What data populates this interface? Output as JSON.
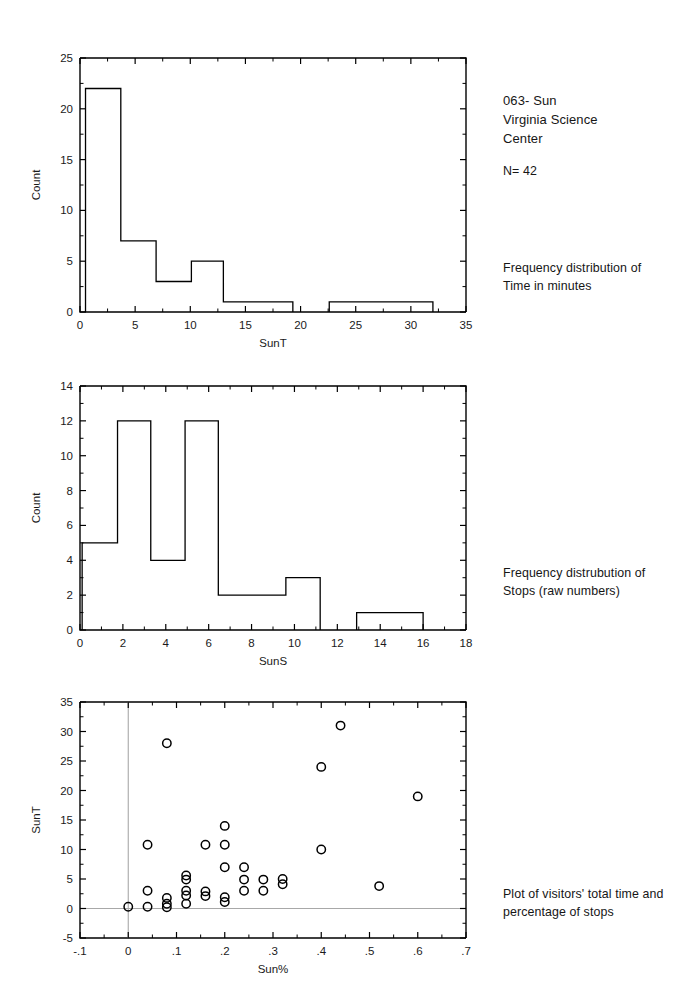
{
  "page": {
    "background": "#ffffff",
    "ink": "#000000",
    "grid_color": "#a8a8a8"
  },
  "annotations": {
    "header": "063- Sun\nVirginia Science\nCenter",
    "sample_size": "N= 42",
    "caption_1": "Frequency distribution of\nTime in minutes",
    "caption_2": "Frequency distrubution of\nStops (raw numbers)",
    "caption_3": "Plot of visitors' total time and\npercentage of stops"
  },
  "chart_data": [
    {
      "id": "sunt-histogram",
      "type": "bar",
      "title": "",
      "xlabel": "SunT",
      "ylabel": "Count",
      "xlim": [
        0,
        35
      ],
      "ylim": [
        0,
        25
      ],
      "xticks": [
        0,
        5,
        10,
        15,
        20,
        25,
        30,
        35
      ],
      "xtick_labels": [
        "0",
        "5",
        "10",
        "15",
        "20",
        "25",
        "30",
        "35"
      ],
      "yticks": [
        0,
        5,
        10,
        15,
        20,
        25
      ],
      "ytick_labels": [
        "0",
        "5",
        "10",
        "15",
        "20",
        "25"
      ],
      "grid": false,
      "legend": "none",
      "bin_edges": [
        0.5,
        3.7,
        6.9,
        10.1,
        13.0,
        16.2,
        19.3,
        22.6,
        25.8,
        28.9,
        32.0
      ],
      "bins": [
        {
          "x0": 0.5,
          "x1": 3.7,
          "count": 22
        },
        {
          "x0": 3.7,
          "x1": 6.9,
          "count": 7
        },
        {
          "x0": 6.9,
          "x1": 10.1,
          "count": 3
        },
        {
          "x0": 10.1,
          "x1": 13.0,
          "count": 5
        },
        {
          "x0": 13.0,
          "x1": 16.2,
          "count": 1
        },
        {
          "x0": 16.2,
          "x1": 19.3,
          "count": 1
        },
        {
          "x0": 22.6,
          "x1": 25.8,
          "count": 1
        },
        {
          "x0": 25.8,
          "x1": 28.9,
          "count": 1
        },
        {
          "x0": 28.9,
          "x1": 32.0,
          "count": 1
        }
      ]
    },
    {
      "id": "suns-histogram",
      "type": "bar",
      "title": "",
      "xlabel": "SunS",
      "ylabel": "Count",
      "xlim": [
        0,
        18
      ],
      "ylim": [
        0,
        14
      ],
      "xticks": [
        0,
        2,
        4,
        6,
        8,
        10,
        12,
        14,
        16,
        18
      ],
      "xtick_labels": [
        "0",
        "2",
        "4",
        "6",
        "8",
        "10",
        "12",
        "14",
        "16",
        "18"
      ],
      "yticks": [
        0,
        2,
        4,
        6,
        8,
        10,
        12,
        14
      ],
      "ytick_labels": [
        "0",
        "2",
        "4",
        "6",
        "8",
        "10",
        "12",
        "14"
      ],
      "grid": false,
      "legend": "none",
      "bin_edges": [
        0.1,
        1.75,
        3.3,
        4.9,
        6.45,
        8.0,
        9.6,
        11.2,
        12.9,
        14.45,
        16.0
      ],
      "bins": [
        {
          "x0": 0.1,
          "x1": 1.75,
          "count": 5
        },
        {
          "x0": 1.75,
          "x1": 3.3,
          "count": 12
        },
        {
          "x0": 3.3,
          "x1": 4.9,
          "count": 4
        },
        {
          "x0": 4.9,
          "x1": 6.45,
          "count": 12
        },
        {
          "x0": 6.45,
          "x1": 8.0,
          "count": 2
        },
        {
          "x0": 8.0,
          "x1": 9.6,
          "count": 2
        },
        {
          "x0": 9.6,
          "x1": 11.2,
          "count": 3
        },
        {
          "x0": 12.9,
          "x1": 14.45,
          "count": 1
        },
        {
          "x0": 14.45,
          "x1": 16.0,
          "count": 1
        }
      ]
    },
    {
      "id": "sunt-vs-sunpct-scatter",
      "type": "scatter",
      "title": "",
      "xlabel": "Sun%",
      "ylabel": "SunT",
      "xlim": [
        -0.1,
        0.7
      ],
      "ylim": [
        -5,
        35
      ],
      "xticks": [
        -0.1,
        0,
        0.1,
        0.2,
        0.3,
        0.4,
        0.5,
        0.6,
        0.7
      ],
      "xtick_labels": [
        "-.1",
        "0",
        ".1",
        ".2",
        ".3",
        ".4",
        ".5",
        ".6",
        ".7"
      ],
      "yticks": [
        -5,
        0,
        5,
        10,
        15,
        20,
        25,
        30,
        35
      ],
      "ytick_labels": [
        "-5",
        "0",
        "5",
        "10",
        "15",
        "20",
        "25",
        "30",
        "35"
      ],
      "grid": false,
      "zero_lines": true,
      "legend": "none",
      "marker": "open-circle",
      "points": [
        {
          "x": 0.0,
          "y": 0.3
        },
        {
          "x": 0.04,
          "y": 0.3
        },
        {
          "x": 0.04,
          "y": 3.0
        },
        {
          "x": 0.04,
          "y": 10.8
        },
        {
          "x": 0.08,
          "y": 0.2
        },
        {
          "x": 0.08,
          "y": 0.8
        },
        {
          "x": 0.08,
          "y": 1.8
        },
        {
          "x": 0.08,
          "y": 28.0
        },
        {
          "x": 0.12,
          "y": 0.8
        },
        {
          "x": 0.12,
          "y": 2.2
        },
        {
          "x": 0.12,
          "y": 3.0
        },
        {
          "x": 0.12,
          "y": 4.9
        },
        {
          "x": 0.12,
          "y": 5.6
        },
        {
          "x": 0.16,
          "y": 2.1
        },
        {
          "x": 0.16,
          "y": 2.9
        },
        {
          "x": 0.16,
          "y": 10.8
        },
        {
          "x": 0.2,
          "y": 1.1
        },
        {
          "x": 0.2,
          "y": 1.9
        },
        {
          "x": 0.2,
          "y": 7.0
        },
        {
          "x": 0.2,
          "y": 10.8
        },
        {
          "x": 0.2,
          "y": 14.0
        },
        {
          "x": 0.24,
          "y": 3.0
        },
        {
          "x": 0.24,
          "y": 4.9
        },
        {
          "x": 0.24,
          "y": 7.0
        },
        {
          "x": 0.28,
          "y": 3.0
        },
        {
          "x": 0.28,
          "y": 4.9
        },
        {
          "x": 0.32,
          "y": 4.1
        },
        {
          "x": 0.32,
          "y": 5.0
        },
        {
          "x": 0.4,
          "y": 10.0
        },
        {
          "x": 0.4,
          "y": 24.0
        },
        {
          "x": 0.44,
          "y": 31.0
        },
        {
          "x": 0.52,
          "y": 3.8
        },
        {
          "x": 0.6,
          "y": 19.0
        }
      ]
    }
  ]
}
